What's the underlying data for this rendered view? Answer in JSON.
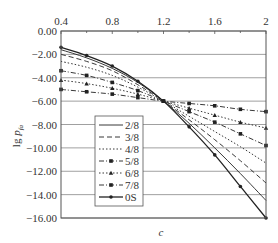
{
  "chart_data": {
    "type": "line",
    "title": "",
    "xlabel": "c",
    "ylabel": "lg p_fa",
    "xlim": [
      0.4,
      2.0
    ],
    "ylim": [
      -16.0,
      0.0
    ],
    "x_ticks": [
      "0.4",
      "0.8",
      "1.2",
      "1.6",
      "2"
    ],
    "y_ticks": [
      "0.00",
      "-2.00",
      "-4.00",
      "-6.00",
      "-8.00",
      "-10.00",
      "-12.00",
      "-14.00",
      "-16.00"
    ],
    "grid": "horizontal",
    "legend_position": "lower-left inside",
    "x": [
      0.4,
      0.6,
      0.8,
      1.0,
      1.2,
      1.4,
      1.6,
      1.8,
      2.0
    ],
    "series": [
      {
        "name": "2/8",
        "style": "solid",
        "marker": "none",
        "values": [
          -1.6,
          -2.3,
          -3.2,
          -4.4,
          -6.0,
          -7.9,
          -10.0,
          -12.2,
          -14.5
        ]
      },
      {
        "name": "3/8",
        "style": "dashed",
        "marker": "none",
        "values": [
          -2.0,
          -2.6,
          -3.4,
          -4.6,
          -6.0,
          -7.6,
          -9.3,
          -11.1,
          -13.0
        ]
      },
      {
        "name": "4/8",
        "style": "dotted",
        "marker": "none",
        "values": [
          -2.6,
          -3.1,
          -3.8,
          -4.8,
          -6.0,
          -7.3,
          -8.6,
          -9.9,
          -11.3
        ]
      },
      {
        "name": "5/8",
        "style": "dash-dot",
        "marker": "square",
        "values": [
          -3.4,
          -3.8,
          -4.4,
          -5.1,
          -6.0,
          -6.9,
          -7.8,
          -8.8,
          -9.8
        ]
      },
      {
        "name": "6/8",
        "style": "dotted",
        "marker": "triangle",
        "values": [
          -4.2,
          -4.5,
          -4.9,
          -5.4,
          -6.0,
          -6.6,
          -7.2,
          -7.8,
          -8.3
        ]
      },
      {
        "name": "7/8",
        "style": "dash-dot",
        "marker": "square",
        "values": [
          -5.0,
          -5.2,
          -5.4,
          -5.7,
          -6.0,
          -6.2,
          -6.4,
          -6.7,
          -6.9
        ]
      },
      {
        "name": "0S",
        "style": "solid",
        "marker": "circle",
        "values": [
          -1.4,
          -2.1,
          -3.0,
          -4.3,
          -6.0,
          -8.2,
          -10.6,
          -13.3,
          -16.0
        ]
      }
    ]
  }
}
